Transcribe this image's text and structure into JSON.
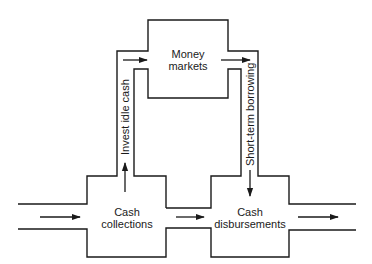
{
  "diagram": {
    "type": "cash-flow-pipe-diagram",
    "stroke_color": "#1a1a1a",
    "background": "#ffffff",
    "nodes": {
      "money_markets": {
        "line1": "Money",
        "line2": "markets"
      },
      "cash_collections": {
        "line1": "Cash",
        "line2": "collections"
      },
      "cash_disbursements": {
        "line1": "Cash",
        "line2": "disbursements"
      }
    },
    "flows": {
      "invest_idle_cash": "Invest idle cash",
      "short_term_borrowing": "Short-term borrowing"
    },
    "arrows": [
      {
        "name": "inflow-arrow",
        "direction": "right"
      },
      {
        "name": "invest-up-arrow",
        "direction": "up"
      },
      {
        "name": "to-money-markets-arrow",
        "direction": "right"
      },
      {
        "name": "from-money-markets-arrow",
        "direction": "right"
      },
      {
        "name": "borrowing-down-arrow",
        "direction": "down"
      },
      {
        "name": "collections-to-disbursements-arrow",
        "direction": "right"
      },
      {
        "name": "outflow-arrow",
        "direction": "right"
      }
    ]
  }
}
